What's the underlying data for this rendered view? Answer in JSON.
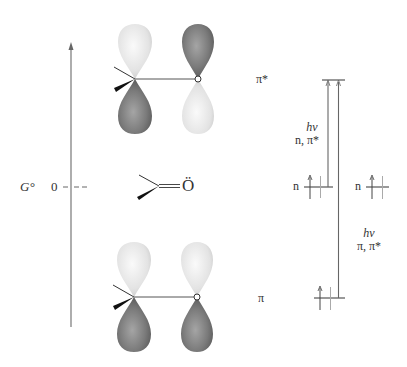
{
  "axis": {
    "label": "G°",
    "zero_label": "0"
  },
  "orbitals": {
    "pi_star": {
      "label": "π*"
    },
    "pi": {
      "label": "π"
    }
  },
  "molecule": {
    "oxygen_symbol": "Ö"
  },
  "energy_levels": {
    "pi_star": {
      "label": ""
    },
    "n_left": {
      "label": "n"
    },
    "n_right": {
      "label": "n"
    },
    "pi": {
      "label": ""
    }
  },
  "transitions": {
    "n_pi_star": {
      "energy": "hν",
      "label": "n, π*"
    },
    "pi_pi_star": {
      "energy": "hν",
      "label": "π, π*"
    }
  },
  "colors": {
    "line": "#555555",
    "light_lobe": "#e6e6e6",
    "dark_lobe": "#7a7a7a",
    "text": "#333333"
  }
}
